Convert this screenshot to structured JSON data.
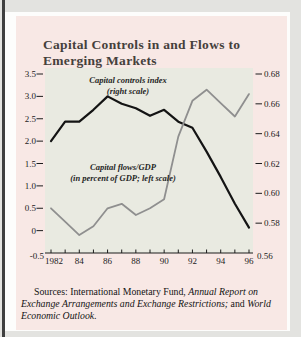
{
  "figure": {
    "title_line1": "Capital Controls in and Flows to",
    "title_line2": "Emerging Markets",
    "annotation_controls_line1": "Capital controls index",
    "annotation_controls_line2": "(right scale)",
    "annotation_flows_line1": "Capital flows/GDP",
    "annotation_flows_line2": "(in percent of GDP; left scale)",
    "sources_prefix": "Sources:  International Monetary Fund, ",
    "sources_italic1": "Annual Report on Exchange Arrangements and Exchange Restrictions;",
    "sources_mid": " and ",
    "sources_italic2": "World Economic Outlook."
  },
  "colors": {
    "card_background": "#f8e8e5",
    "plot_background": "#e9eae1",
    "controls_line": "#141414",
    "flows_line": "#8f8f8f",
    "axis": "#1c1c1c"
  },
  "chart_data": {
    "type": "line",
    "title": "Capital Controls in and Flows to Emerging Markets",
    "x": [
      1982,
      1983,
      1984,
      1985,
      1986,
      1987,
      1988,
      1989,
      1990,
      1991,
      1992,
      1993,
      1994,
      1995,
      1996
    ],
    "x_axis": {
      "range": [
        1982,
        1996
      ],
      "tick_every_year": true,
      "labels": [
        {
          "text": "1982",
          "year": 1982
        },
        {
          "text": "84",
          "year": 1984
        },
        {
          "text": "86",
          "year": 1986
        },
        {
          "text": "88",
          "year": 1988
        },
        {
          "text": "90",
          "year": 1990
        },
        {
          "text": "92",
          "year": 1992
        },
        {
          "text": "94",
          "year": 1994
        },
        {
          "text": "96",
          "year": 1996
        }
      ]
    },
    "left_axis": {
      "range": [
        -0.5,
        3.5
      ],
      "ticks": [
        {
          "v": 3.5,
          "text": "3.5"
        },
        {
          "v": 3.0,
          "text": "3.0"
        },
        {
          "v": 2.5,
          "text": "2.5"
        },
        {
          "v": 2.0,
          "text": "2.0"
        },
        {
          "v": 1.5,
          "text": "1.5"
        },
        {
          "v": 1.0,
          "text": "1.0"
        },
        {
          "v": 0.5,
          "text": "0.5"
        },
        {
          "v": 0,
          "text": "0"
        },
        {
          "v": -0.5,
          "text": "-0.5",
          "edge": true
        }
      ]
    },
    "right_axis": {
      "range": [
        0.56,
        0.68
      ],
      "ticks": [
        {
          "v": 0.68,
          "text": "0.68"
        },
        {
          "v": 0.66,
          "text": "0.66"
        },
        {
          "v": 0.64,
          "text": "0.64"
        },
        {
          "v": 0.62,
          "text": "0.62"
        },
        {
          "v": 0.6,
          "text": "0.60"
        },
        {
          "v": 0.58,
          "text": "0.58"
        },
        {
          "v": 0.56,
          "text": "0.56",
          "edge": true
        }
      ]
    },
    "series": [
      {
        "name": "Capital controls index",
        "axis": "right",
        "color": "#141414",
        "width": 2.2,
        "values": [
          0.635,
          0.648,
          0.648,
          0.656,
          0.665,
          0.66,
          0.657,
          0.652,
          0.656,
          0.648,
          0.644,
          0.628,
          0.611,
          0.593,
          0.577
        ]
      },
      {
        "name": "Capital flows/GDP (in percent of GDP)",
        "axis": "left",
        "color": "#8f8f8f",
        "width": 1.8,
        "values": [
          0.5,
          0.2,
          -0.1,
          0.1,
          0.5,
          0.6,
          0.35,
          0.5,
          0.7,
          2.1,
          2.9,
          3.15,
          2.85,
          2.55,
          3.05
        ]
      }
    ],
    "legend_position": "in-plot annotations",
    "grid": false
  }
}
